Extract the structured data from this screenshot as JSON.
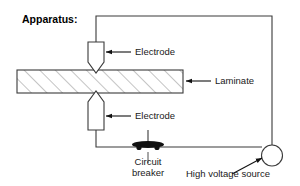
{
  "figure": {
    "title": "Apparatus:",
    "background_color": "#ffffff",
    "line_color": "#3a3a3a",
    "text_color": "#1a1a1a",
    "hatch_color": "#8a8a8a"
  },
  "labels": {
    "electrode_top": "Electrode",
    "electrode_bottom": "Electrode",
    "laminate": "Laminate",
    "circuit_breaker_line1": "Circuit",
    "circuit_breaker_line2": "breaker",
    "high_voltage_source": "High voltage source"
  },
  "components": {
    "electrode_top_name": "electrode-top",
    "electrode_bottom_name": "electrode-bottom",
    "laminate_name": "laminate-block",
    "circuit_breaker_name": "circuit-breaker",
    "source_name": "high-voltage-source"
  }
}
